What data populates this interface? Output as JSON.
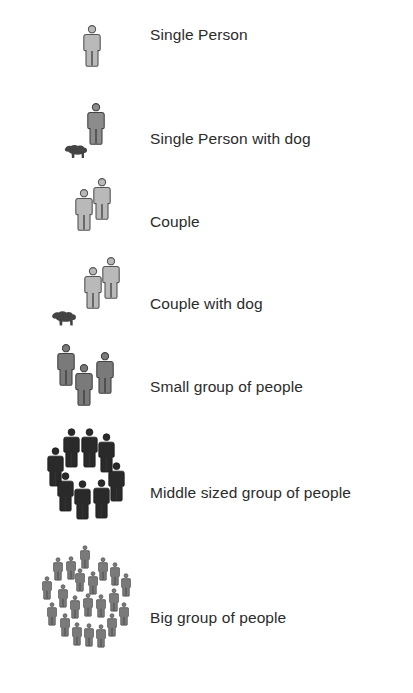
{
  "legend": {
    "items": [
      {
        "id": "single-person",
        "label": "Single Person",
        "icon": "person-icon",
        "count": 1,
        "dog": false,
        "fill": "#b9b9b9"
      },
      {
        "id": "single-person-with-dog",
        "label": "Single Person with dog",
        "icon": "person-with-dog-icon",
        "count": 1,
        "dog": true,
        "fill": "#8c8c8c"
      },
      {
        "id": "couple",
        "label": "Couple",
        "icon": "couple-icon",
        "count": 2,
        "dog": false,
        "fill": "#b9b9b9"
      },
      {
        "id": "couple-with-dog",
        "label": "Couple with dog",
        "icon": "couple-with-dog-icon",
        "count": 2,
        "dog": true,
        "fill": "#b9b9b9"
      },
      {
        "id": "small-group",
        "label": "Small group of people",
        "icon": "small-group-icon",
        "count": 3,
        "dog": false,
        "fill": "#7a7a7a"
      },
      {
        "id": "middle-group",
        "label": "Middle sized group of people",
        "icon": "middle-group-icon",
        "count": 9,
        "dog": false,
        "fill": "#2a2a2a"
      },
      {
        "id": "big-group",
        "label": "Big group of people",
        "icon": "big-group-icon",
        "count": 25,
        "dog": false,
        "fill": "#7a7a7a"
      }
    ]
  },
  "colors": {
    "text": "#2b2b2b",
    "outline": "#555555",
    "dog": "#444444",
    "background": "#ffffff"
  }
}
